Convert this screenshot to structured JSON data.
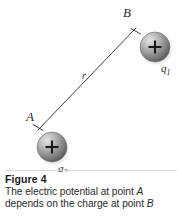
{
  "figure": {
    "label": "Figure 4",
    "caption_line_1_part_1": "The electric potential at point ",
    "caption_line_1_point": "A",
    "caption_line_2_part_1": "depends on the charge at point ",
    "caption_line_2_point": "B"
  },
  "diagram": {
    "type": "physics-schematic",
    "background_color": "#ffffff",
    "line_color": "#3a3a3a",
    "point_b": {
      "label": "B",
      "label_x": 127,
      "label_y": 14,
      "tick_x": 136,
      "tick_y": 28
    },
    "point_a": {
      "label": "A",
      "label_x": 29,
      "label_y": 118,
      "tick_x": 38,
      "tick_y": 130
    },
    "distance": {
      "label": "r",
      "label_x": 83,
      "label_y": 76
    },
    "connector": {
      "x1": 38,
      "y1": 130,
      "x2": 136,
      "y2": 28,
      "stroke_width": 1
    },
    "charges": [
      {
        "name": "q1",
        "label": "q",
        "subscript": "1",
        "sign": "+",
        "cx": 155,
        "cy": 47,
        "r": 15,
        "label_x": 163,
        "label_y": 69,
        "fill_light": "#d8d8d8",
        "fill_mid": "#9a9a9a",
        "fill_dark": "#5a5a5a"
      },
      {
        "name": "q2",
        "label": "q",
        "subscript": "2",
        "sign": "+",
        "cx": 52,
        "cy": 147,
        "r": 15,
        "label_x": 60,
        "label_y": 169,
        "fill_light": "#d8d8d8",
        "fill_mid": "#9a9a9a",
        "fill_dark": "#5a5a5a"
      }
    ]
  }
}
